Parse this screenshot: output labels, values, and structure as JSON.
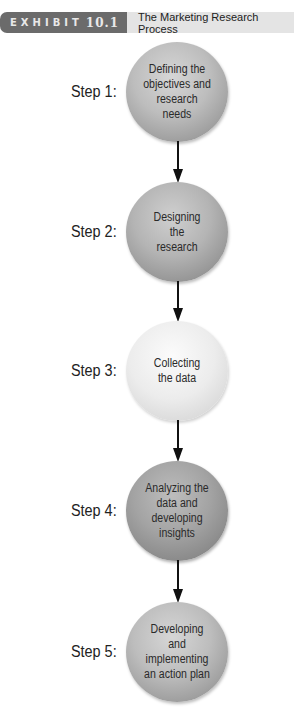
{
  "header": {
    "exhibit_label": "EXHIBIT",
    "exhibit_number": "10.1",
    "title": "The Marketing Research Process"
  },
  "steps": [
    {
      "label": "Step 1:",
      "text": "Defining the objectives and research needs"
    },
    {
      "label": "Step 2:",
      "text": "Designing the research"
    },
    {
      "label": "Step 3:",
      "text": "Collecting the data"
    },
    {
      "label": "Step 4:",
      "text": "Analyzing the data and developing insights"
    },
    {
      "label": "Step 5:",
      "text": "Developing and implementing an action plan"
    }
  ],
  "colors": {
    "header_tag_bg": "#6b6b6b",
    "header_title_bg": "#e4e4e4",
    "arrow": "#111111"
  }
}
